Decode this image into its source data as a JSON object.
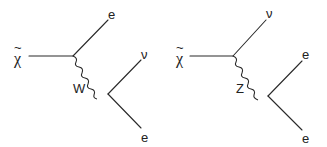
{
  "diagrams": [
    {
      "name": "w-exchange",
      "initial": {
        "label": "χ",
        "tilde": "~"
      },
      "propagator": {
        "label": "W"
      },
      "outgoing_top": {
        "label": "e"
      },
      "outgoing_mid": {
        "label": "ν"
      },
      "outgoing_bottom": {
        "label": "e"
      }
    },
    {
      "name": "z-exchange",
      "initial": {
        "label": "χ",
        "tilde": "~"
      },
      "propagator": {
        "label": "Z"
      },
      "outgoing_top": {
        "label": "ν"
      },
      "outgoing_mid": {
        "label": "e"
      },
      "outgoing_bottom": {
        "label": "e"
      }
    }
  ],
  "colors": {
    "ink": "#2a2a2a",
    "background": "#ffffff"
  }
}
